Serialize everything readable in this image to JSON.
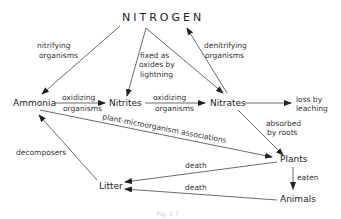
{
  "diagram": {
    "title": "NITROGEN",
    "nodes": {
      "ammonia": "Ammonia",
      "nitrites": "Nitrites",
      "nitrates": "Nitrates",
      "plants": "Plants",
      "animals": "Animals",
      "litter": "Litter"
    },
    "edges": {
      "nitrifying_1": "nitrifying",
      "nitrifying_2": "organisms",
      "fixed_1": "fixed as",
      "fixed_2": "oxides by",
      "fixed_3": "lightning",
      "denitrifying_1": "denitrifying",
      "denitrifying_2": "organisms",
      "oxidizing_a1": "oxidizing",
      "oxidizing_a2": "organisms",
      "oxidizing_b1": "oxidizing",
      "oxidizing_b2": "organisms",
      "leaching_1": "loss by",
      "leaching_2": "leaching",
      "absorbed_1": "absorbed",
      "absorbed_2": "by roots",
      "plant_micro": "plant-microorganism associations",
      "decomposers": "decomposers",
      "death_plants": "death",
      "death_animals": "death",
      "eaten": "eaten"
    },
    "caption": "Fig. 1.7"
  }
}
